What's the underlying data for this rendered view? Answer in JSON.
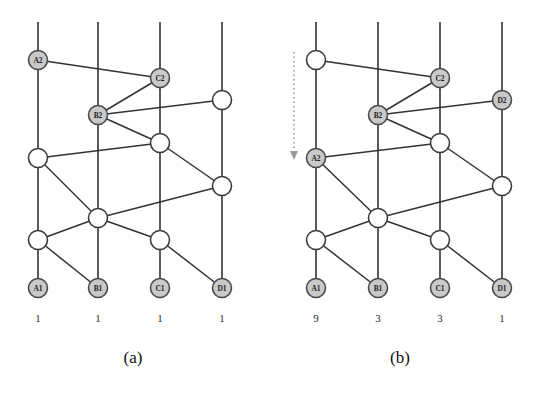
{
  "figure": {
    "panels": [
      {
        "id": "panel-a",
        "caption": "(a)",
        "columns": [
          {
            "name": "A",
            "x": 38,
            "bottom_label": "A1",
            "count": "1"
          },
          {
            "name": "B",
            "x": 98,
            "bottom_label": "B1",
            "count": "1"
          },
          {
            "name": "C",
            "x": 160,
            "bottom_label": "C1",
            "count": "1"
          },
          {
            "name": "D",
            "x": 222,
            "bottom_label": "D1",
            "count": "1"
          }
        ],
        "nodes": [
          {
            "id": "a-A2",
            "x": 38,
            "y": 60,
            "label": "A2",
            "shaded": true
          },
          {
            "id": "a-C2",
            "x": 160,
            "y": 78,
            "label": "C2",
            "shaded": true
          },
          {
            "id": "a-D3",
            "x": 222,
            "y": 100,
            "label": "",
            "shaded": false
          },
          {
            "id": "a-B2",
            "x": 98,
            "y": 115,
            "label": "B2",
            "shaded": true
          },
          {
            "id": "a-A3",
            "x": 38,
            "y": 158,
            "label": "",
            "shaded": false
          },
          {
            "id": "a-C3",
            "x": 160,
            "y": 143,
            "label": "",
            "shaded": false
          },
          {
            "id": "a-D4",
            "x": 222,
            "y": 186,
            "label": "",
            "shaded": false
          },
          {
            "id": "a-B3",
            "x": 98,
            "y": 218,
            "label": "",
            "shaded": false
          },
          {
            "id": "a-A4",
            "x": 38,
            "y": 240,
            "label": "",
            "shaded": false
          },
          {
            "id": "a-C4",
            "x": 160,
            "y": 240,
            "label": "",
            "shaded": false
          },
          {
            "id": "a-A1",
            "x": 38,
            "y": 288,
            "label": "A1",
            "shaded": true
          },
          {
            "id": "a-B1",
            "x": 98,
            "y": 288,
            "label": "B1",
            "shaded": true
          },
          {
            "id": "a-C1",
            "x": 160,
            "y": 288,
            "label": "C1",
            "shaded": true
          },
          {
            "id": "a-D1",
            "x": 222,
            "y": 288,
            "label": "D1",
            "shaded": true
          }
        ],
        "rails": [
          {
            "x": 38,
            "y1": 22,
            "y2": 288
          },
          {
            "x": 98,
            "y1": 22,
            "y2": 288
          },
          {
            "x": 160,
            "y1": 22,
            "y2": 288
          },
          {
            "x": 222,
            "y1": 22,
            "y2": 288
          }
        ],
        "edges": [
          {
            "from": "a-A2",
            "to": "a-C2"
          },
          {
            "from": "a-B2",
            "to": "a-C2"
          },
          {
            "from": "a-B2",
            "to": "a-D3"
          },
          {
            "from": "a-B2",
            "to": "a-C3"
          },
          {
            "from": "a-A3",
            "to": "a-C3"
          },
          {
            "from": "a-A3",
            "to": "a-B3"
          },
          {
            "from": "a-C3",
            "to": "a-D4"
          },
          {
            "from": "a-A4",
            "to": "a-B3"
          },
          {
            "from": "a-B3",
            "to": "a-D4"
          },
          {
            "from": "a-A4",
            "to": "a-B1"
          },
          {
            "from": "a-C4",
            "to": "a-D1"
          },
          {
            "from": "a-B3",
            "to": "a-C4"
          }
        ],
        "arrow": null
      },
      {
        "id": "panel-b",
        "caption": "(b)",
        "columns": [
          {
            "name": "A",
            "x": 49,
            "bottom_label": "A1",
            "count": "9"
          },
          {
            "name": "B",
            "x": 111,
            "bottom_label": "B1",
            "count": "3"
          },
          {
            "name": "C",
            "x": 173,
            "bottom_label": "C1",
            "count": "3"
          },
          {
            "name": "D",
            "x": 235,
            "bottom_label": "D1",
            "count": "1"
          }
        ],
        "nodes": [
          {
            "id": "b-A2",
            "x": 49,
            "y": 60,
            "label": "",
            "shaded": false
          },
          {
            "id": "b-C2",
            "x": 173,
            "y": 78,
            "label": "C2",
            "shaded": true
          },
          {
            "id": "b-D3",
            "x": 235,
            "y": 100,
            "label": "D2",
            "shaded": true
          },
          {
            "id": "b-B2",
            "x": 111,
            "y": 115,
            "label": "B2",
            "shaded": true
          },
          {
            "id": "b-A3",
            "x": 49,
            "y": 158,
            "label": "A2",
            "shaded": true
          },
          {
            "id": "b-C3",
            "x": 173,
            "y": 143,
            "label": "",
            "shaded": false
          },
          {
            "id": "b-D4",
            "x": 235,
            "y": 186,
            "label": "",
            "shaded": false
          },
          {
            "id": "b-B3",
            "x": 111,
            "y": 218,
            "label": "",
            "shaded": false
          },
          {
            "id": "b-A4",
            "x": 49,
            "y": 240,
            "label": "",
            "shaded": false
          },
          {
            "id": "b-C4",
            "x": 173,
            "y": 240,
            "label": "",
            "shaded": false
          },
          {
            "id": "b-A1",
            "x": 49,
            "y": 288,
            "label": "A1",
            "shaded": true
          },
          {
            "id": "b-B1",
            "x": 111,
            "y": 288,
            "label": "B1",
            "shaded": true
          },
          {
            "id": "b-C1",
            "x": 173,
            "y": 288,
            "label": "C1",
            "shaded": true
          },
          {
            "id": "b-D1",
            "x": 235,
            "y": 288,
            "label": "D1",
            "shaded": true
          }
        ],
        "rails": [
          {
            "x": 49,
            "y1": 22,
            "y2": 288
          },
          {
            "x": 111,
            "y1": 22,
            "y2": 288
          },
          {
            "x": 173,
            "y1": 22,
            "y2": 288
          },
          {
            "x": 235,
            "y1": 22,
            "y2": 288
          }
        ],
        "edges": [
          {
            "from": "b-A2",
            "to": "b-C2"
          },
          {
            "from": "b-B2",
            "to": "b-C2"
          },
          {
            "from": "b-B2",
            "to": "b-D3"
          },
          {
            "from": "b-B2",
            "to": "b-C3"
          },
          {
            "from": "b-A3",
            "to": "b-C3"
          },
          {
            "from": "b-A3",
            "to": "b-B3"
          },
          {
            "from": "b-C3",
            "to": "b-D4"
          },
          {
            "from": "b-A4",
            "to": "b-B3"
          },
          {
            "from": "b-B3",
            "to": "b-D4"
          },
          {
            "from": "b-A4",
            "to": "b-B1"
          },
          {
            "from": "b-C4",
            "to": "b-D1"
          },
          {
            "from": "b-B3",
            "to": "b-C4"
          }
        ],
        "arrow": {
          "x": 27,
          "y1": 52,
          "y2": 160,
          "direction": "down"
        }
      }
    ]
  }
}
